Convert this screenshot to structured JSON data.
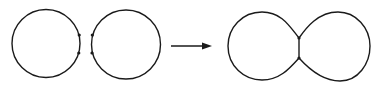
{
  "diagram": {
    "stroke_color": "#1a1a1a",
    "background": "#ffffff",
    "before": {
      "label": "",
      "circles": [
        {
          "cx": 46,
          "cy": 43.5,
          "r": 35,
          "points": [
            [
              80,
              35
            ],
            [
              80,
              53
            ]
          ]
        },
        {
          "cx": 126,
          "cy": 44.5,
          "r": 35,
          "points": [
            [
              92,
              35
            ],
            [
              92,
              53
            ]
          ]
        }
      ]
    },
    "arrow": {
      "x1": 171,
      "y1": 46,
      "x2": 212,
      "y2": 46
    },
    "after": {
      "label": "",
      "junction_points": [
        [
          299,
          38
        ],
        [
          299,
          58
        ]
      ]
    }
  }
}
